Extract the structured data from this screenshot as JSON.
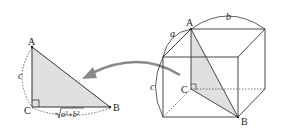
{
  "left_triangle": {
    "vertices": {
      "A": "A",
      "B": "B",
      "C": "C"
    },
    "side_AC_label": "c",
    "side_CB_label": "√(a²+b²)",
    "sqrt_symbol": "√",
    "sqrt_radicand": "a²+b²",
    "fill": "#e0e0e0",
    "right_angle_at": "C"
  },
  "arrow": {
    "color": "#8a8a8a",
    "direction": "from cube to triangle"
  },
  "cuboid": {
    "vertex_labels": {
      "A": "A",
      "B": "B",
      "C": "C"
    },
    "edge_labels": {
      "a": "a",
      "b": "b",
      "c": "c"
    },
    "shaded_triangle": "ACB",
    "fill": "#e0e0e0",
    "right_angle_at": "C"
  }
}
